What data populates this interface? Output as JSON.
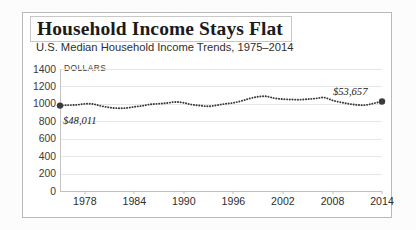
{
  "figure": {
    "title": "Household Income Stays Flat",
    "subtitle": "U.S. Median Household Income Trends, 1975–2014",
    "axis_unit_label": "DOLLARS",
    "border_color": "#b9b9b9",
    "series_color": "#3b3b3b",
    "grid_color": "#e6e6e6"
  },
  "annotations": {
    "start_value_label": "$48,011",
    "end_value_label": "$53,657"
  },
  "chart_data": {
    "type": "line",
    "title": "Household Income Stays Flat",
    "subtitle": "U.S. Median Household Income Trends, 1975–2014",
    "xlabel": "",
    "ylabel": "DOLLARS",
    "ylim": [
      0,
      1400
    ],
    "xlim": [
      1975,
      2014
    ],
    "grid": true,
    "legend": "none",
    "yticks": [
      0,
      200,
      400,
      600,
      800,
      1000,
      1200,
      1400
    ],
    "ytick_labels": [
      "0",
      "200",
      "400",
      "600",
      "800",
      "1000",
      "1200",
      "1400"
    ],
    "xticks": [
      1978,
      1984,
      1990,
      1996,
      2002,
      2008,
      2014
    ],
    "xtick_labels": [
      "1978",
      "1984",
      "1990",
      "1996",
      "2002",
      "2008",
      "2014"
    ],
    "note": "y values are displayed in hundreds of dollars (e.g. 1000 on axis = $50,000 range of plotted series)",
    "markers": [
      {
        "x": 1975,
        "y": 980,
        "label": "$48,011",
        "label_position": "below-right"
      },
      {
        "x": 2014,
        "y": 1027,
        "label": "$53,657",
        "label_position": "above-left"
      }
    ],
    "series": [
      {
        "name": "U.S. Median Household Income",
        "style": "dotted",
        "x": [
          1975,
          1976,
          1977,
          1978,
          1979,
          1980,
          1981,
          1982,
          1983,
          1984,
          1985,
          1986,
          1987,
          1988,
          1989,
          1990,
          1991,
          1992,
          1993,
          1994,
          1995,
          1996,
          1997,
          1998,
          1999,
          2000,
          2001,
          2002,
          2003,
          2004,
          2005,
          2006,
          2007,
          2008,
          2009,
          2010,
          2011,
          2012,
          2013,
          2014
        ],
        "values": [
          980,
          985,
          988,
          1000,
          998,
          975,
          958,
          950,
          952,
          966,
          978,
          995,
          1002,
          1010,
          1022,
          1012,
          990,
          980,
          972,
          984,
          1000,
          1012,
          1034,
          1062,
          1082,
          1086,
          1064,
          1054,
          1050,
          1048,
          1054,
          1062,
          1072,
          1040,
          1018,
          1000,
          988,
          986,
          1006,
          1027
        ]
      }
    ]
  }
}
